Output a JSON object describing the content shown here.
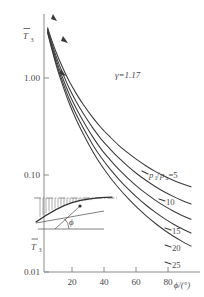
{
  "figure": {
    "name": "shock-temperature-ratio-chart",
    "background_color": "#ffffff",
    "ink_color": "#4a4a4a"
  },
  "chart_data": {
    "type": "line",
    "title": "",
    "subtitle": "",
    "xlabel": "ϕ/(°)",
    "ylabel": "T̅₃",
    "xlim": [
      8,
      95
    ],
    "ylim": [
      0.01,
      4.0
    ],
    "yscale": "log",
    "xscale": "linear",
    "grid": false,
    "legend_position": "inline-right-of-curves",
    "xticks": [
      20,
      40,
      60,
      80
    ],
    "xticklabels": [
      "20",
      "40",
      "60",
      "80"
    ],
    "yticks": [
      1.0,
      0.1,
      0.01
    ],
    "yticklabels": [
      "1.00",
      "0.10",
      "0.01"
    ],
    "annotations": [
      {
        "name": "gamma-annotation",
        "text": "γ=1.17",
        "x": 52,
        "y": 1.35
      },
      {
        "name": "inset-label",
        "text": "T̅₃",
        "x": 13,
        "y": 0.018
      },
      {
        "name": "inset-angle-label",
        "text": "ϕ",
        "x": 28,
        "y": 0.028
      }
    ],
    "series": [
      {
        "name": "p1/pa = 5",
        "label": "p₁/pₐ=5",
        "label_value": "5",
        "label_prefix": "p₁/pₐ=",
        "x": [
          10,
          12,
          15,
          18,
          22,
          26,
          30,
          35,
          40,
          45,
          50,
          55,
          60,
          65,
          70,
          75,
          80,
          85,
          90
        ],
        "y": [
          3.3,
          2.55,
          1.8,
          1.33,
          0.93,
          0.69,
          0.53,
          0.395,
          0.305,
          0.245,
          0.2,
          0.168,
          0.143,
          0.124,
          0.109,
          0.0975,
          0.0885,
          0.0812,
          0.0755
        ]
      },
      {
        "name": "p1/pa = 10",
        "label": "10",
        "x": [
          10,
          12,
          15,
          18,
          22,
          26,
          30,
          35,
          40,
          45,
          50,
          55,
          60,
          65,
          70,
          75,
          80,
          85,
          90
        ],
        "y": [
          3.2,
          2.4,
          1.63,
          1.17,
          0.79,
          0.57,
          0.428,
          0.31,
          0.233,
          0.184,
          0.148,
          0.122,
          0.1025,
          0.0878,
          0.0762,
          0.0672,
          0.0602,
          0.0547,
          0.0503
        ]
      },
      {
        "name": "p1/pa = 15",
        "label": "15",
        "x": [
          10,
          12,
          15,
          18,
          22,
          26,
          30,
          35,
          40,
          45,
          50,
          55,
          60,
          65,
          70,
          75,
          80,
          85,
          90
        ],
        "y": [
          3.1,
          2.28,
          1.5,
          1.05,
          0.688,
          0.485,
          0.356,
          0.25,
          0.184,
          0.1425,
          0.1128,
          0.0918,
          0.076,
          0.0642,
          0.0551,
          0.048,
          0.0426,
          0.0383,
          0.035
        ]
      },
      {
        "name": "p1/pa = 20",
        "label": "20",
        "x": [
          10,
          12,
          15,
          18,
          22,
          26,
          30,
          35,
          40,
          45,
          50,
          55,
          60,
          65,
          70,
          75,
          80,
          85,
          90
        ],
        "y": [
          3.0,
          2.18,
          1.4,
          0.958,
          0.61,
          0.42,
          0.303,
          0.208,
          0.1505,
          0.1142,
          0.0892,
          0.0715,
          0.0585,
          0.0488,
          0.0414,
          0.0357,
          0.0313,
          0.0279,
          0.0252
        ]
      },
      {
        "name": "p1/pa = 25",
        "label": "25",
        "x": [
          10,
          12,
          15,
          18,
          22,
          26,
          30,
          35,
          40,
          45,
          50,
          55,
          60,
          65,
          70,
          75,
          80,
          85,
          90
        ],
        "y": [
          2.92,
          2.1,
          1.32,
          0.885,
          0.552,
          0.372,
          0.263,
          0.177,
          0.1258,
          0.0938,
          0.0722,
          0.057,
          0.046,
          0.0379,
          0.0318,
          0.0271,
          0.0235,
          0.0207,
          0.0185
        ]
      }
    ],
    "curve_labels": [
      {
        "name": "curve-label-5",
        "text": "p₁/pₐ=5",
        "x": 148,
        "y": 175
      },
      {
        "name": "curve-label-10",
        "text": "10",
        "x": 166,
        "y": 202
      },
      {
        "name": "curve-label-15",
        "text": "15",
        "x": 172,
        "y": 231
      },
      {
        "name": "curve-label-20",
        "text": "20",
        "x": 172,
        "y": 248
      },
      {
        "name": "curve-label-25",
        "text": "25",
        "x": 172,
        "y": 265
      }
    ]
  },
  "inset": {
    "name": "shock-geometry-inset",
    "description": "airfoil shock geometry with hatched pressure distribution and wedge angle phi",
    "angle_symbol": "ϕ",
    "temperature_symbol": "T̅₃"
  }
}
